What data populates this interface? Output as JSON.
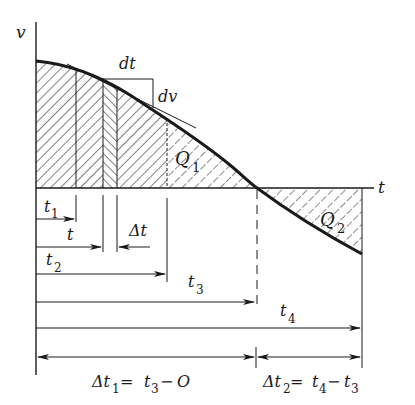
{
  "diagram": {
    "title": "",
    "axes": {
      "y_label": "v",
      "x_label": "t"
    },
    "curve": {
      "description": "velocity v(t) decreasing, crossing t-axis at t3 and ending at t4",
      "points": [
        [
          36,
          61
        ],
        [
          90,
          73
        ],
        [
          150,
          110
        ],
        [
          210,
          150
        ],
        [
          257,
          188
        ],
        [
          310,
          226
        ],
        [
          362,
          254
        ]
      ]
    },
    "regions": [
      {
        "id": "Q1",
        "label": "Q",
        "subscript": "1",
        "description": "area under curve above axis from 0 to t3"
      },
      {
        "id": "Q2",
        "label": "Q",
        "subscript": "2",
        "description": "area between axis and curve below axis from t3 to t4"
      }
    ],
    "tangent_annotation": {
      "dt_label": "dt",
      "dv_label": "dv"
    },
    "time_markers": [
      {
        "name": "t1",
        "label": "t",
        "subscript": "1"
      },
      {
        "name": "t",
        "label": "t",
        "subscript": ""
      },
      {
        "name": "delta_t",
        "label": "Δt",
        "subscript": ""
      },
      {
        "name": "t2",
        "label": "t",
        "subscript": "2"
      },
      {
        "name": "t3",
        "label": "t",
        "subscript": "3"
      },
      {
        "name": "t4",
        "label": "t",
        "subscript": "4"
      }
    ],
    "intervals": [
      {
        "name": "delta_t1",
        "lhs": "Δt",
        "lhs_sub": "1",
        "eq": "= ",
        "rhs_a": "t",
        "rhs_a_sub": "3",
        "rhs_op": "−",
        "rhs_b": "O",
        "rhs_b_sub": ""
      },
      {
        "name": "delta_t2",
        "lhs": "Δt",
        "lhs_sub": "2",
        "eq": "= ",
        "rhs_a": "t",
        "rhs_a_sub": "4",
        "rhs_op": "−",
        "rhs_b": "t",
        "rhs_b_sub": "3"
      }
    ],
    "colors": {
      "ink": "#1a1a1a",
      "background": "#ffffff"
    }
  }
}
